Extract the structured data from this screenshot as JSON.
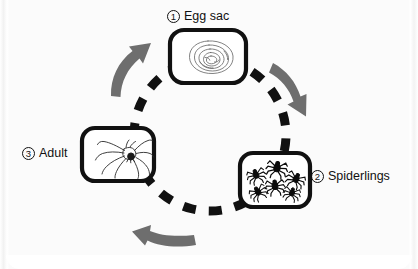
{
  "figure": {
    "background_color": "#fbfbfb",
    "cycle": {
      "path_style": "dashed-circle",
      "path_color": "#111111",
      "arrow_color": "#6e6e6e",
      "direction": "clockwise",
      "center": {
        "x": 210,
        "y": 135
      },
      "radius": 76
    },
    "stages": [
      {
        "id": "egg-sac",
        "number": "1",
        "label": "Egg sac",
        "label_position": "above",
        "icon": "egg-sac-icon",
        "icon_description": "silk egg sac drawn as concentric irregular spiral lines",
        "box": {
          "x": 170,
          "y": 30,
          "width": 76,
          "height": 53
        }
      },
      {
        "id": "spiderlings",
        "number": "2",
        "label": "Spiderlings",
        "label_position": "right",
        "icon": "spiderlings-icon",
        "icon_description": "six small solid black baby spiders scattered in the frame",
        "spiderling_count": 6,
        "box": {
          "x": 240,
          "y": 153,
          "width": 70,
          "height": 54
        }
      },
      {
        "id": "adult",
        "number": "3",
        "label": "Adult",
        "label_position": "left",
        "icon": "adult-spider-icon",
        "icon_description": "line-drawn adult spider with eight long legs",
        "box": {
          "x": 82,
          "y": 128,
          "width": 72,
          "height": 53
        }
      }
    ],
    "arrows": [
      {
        "id": "arrow-egg-to-spiderlings",
        "from": "egg-sac",
        "to": "spiderlings",
        "direction": "down-right",
        "color": "#6e6e6e"
      },
      {
        "id": "arrow-spiderlings-to-adult",
        "from": "spiderlings",
        "to": "adult",
        "direction": "left",
        "color": "#6e6e6e"
      },
      {
        "id": "arrow-adult-to-egg",
        "from": "adult",
        "to": "egg-sac",
        "direction": "up-right",
        "color": "#6e6e6e"
      }
    ]
  }
}
